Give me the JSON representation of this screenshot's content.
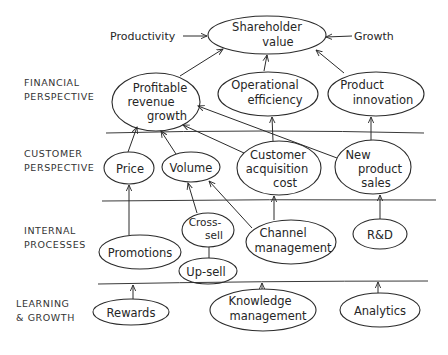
{
  "diagram": {
    "type": "strategy-map",
    "top": {
      "left_driver": "Productivity",
      "right_driver": "Growth",
      "goal": {
        "line1": "Shareholder",
        "line2": "value"
      }
    },
    "perspectives": [
      {
        "id": "financial",
        "line1": "Financial",
        "line2": "Perspective"
      },
      {
        "id": "customer",
        "line1": "Customer",
        "line2": "Perspective"
      },
      {
        "id": "internal",
        "line1": "Internal",
        "line2": "Processes"
      },
      {
        "id": "learning",
        "line1": "Learning",
        "line2": "& Growth"
      }
    ],
    "nodes": {
      "profitable_revenue_growth": {
        "line1": "Profitable",
        "line2": "revenue",
        "line3": "growth"
      },
      "operational_efficiency": {
        "line1": "Operational",
        "line2": "efficiency"
      },
      "product_innovation": {
        "line1": "Product",
        "line2": "innovation"
      },
      "price": {
        "line1": "Price"
      },
      "volume": {
        "line1": "Volume"
      },
      "customer_acquisition_cost": {
        "line1": "Customer",
        "line2": "acquisition",
        "line3": "cost"
      },
      "new_product_sales": {
        "line1": "New",
        "line2": "product",
        "line3": "sales"
      },
      "promotions": {
        "line1": "Promotions"
      },
      "cross_sell": {
        "line1": "Cross-",
        "line2": "sell"
      },
      "up_sell": {
        "line1": "Up-sell"
      },
      "channel_management": {
        "line1": "Channel",
        "line2": "management"
      },
      "rnd": {
        "line1": "R&D"
      },
      "rewards": {
        "line1": "Rewards"
      },
      "knowledge_management": {
        "line1": "Knowledge",
        "line2": "management"
      },
      "analytics": {
        "line1": "Analytics"
      }
    },
    "edges": [
      {
        "from": "Productivity",
        "to": "Shareholder value"
      },
      {
        "from": "Growth",
        "to": "Shareholder value"
      },
      {
        "from": "Profitable revenue growth",
        "to": "Shareholder value"
      },
      {
        "from": "Operational efficiency",
        "to": "Shareholder value"
      },
      {
        "from": "Product innovation",
        "to": "Shareholder value"
      },
      {
        "from": "Price",
        "to": "Profitable revenue growth"
      },
      {
        "from": "Volume",
        "to": "Profitable revenue growth"
      },
      {
        "from": "Customer acquisition cost",
        "to": "Profitable revenue growth"
      },
      {
        "from": "New product sales",
        "to": "Profitable revenue growth"
      },
      {
        "from": "Customer acquisition cost",
        "to": "Operational efficiency"
      },
      {
        "from": "New product sales",
        "to": "Product innovation"
      },
      {
        "from": "Promotions",
        "to": "Price"
      },
      {
        "from": "Cross-sell",
        "to": "Volume"
      },
      {
        "from": "Channel management",
        "to": "Volume"
      },
      {
        "from": "Channel management",
        "to": "Customer acquisition cost"
      },
      {
        "from": "R&D",
        "to": "New product sales"
      },
      {
        "from": "Up-sell",
        "to": "Cross-sell"
      },
      {
        "from": "Rewards",
        "to": "Internal Processes"
      },
      {
        "from": "Knowledge management",
        "to": "Internal Processes"
      },
      {
        "from": "Analytics",
        "to": "Internal Processes"
      }
    ]
  }
}
